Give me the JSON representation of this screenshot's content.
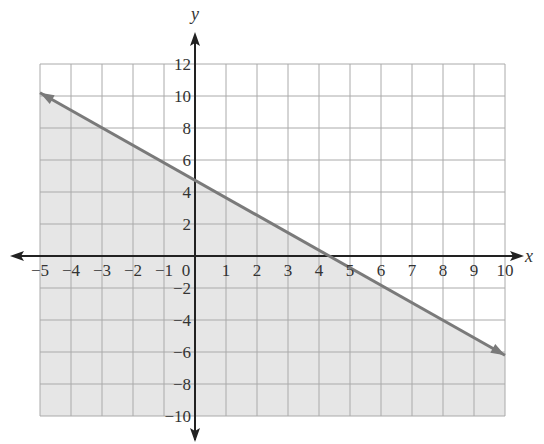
{
  "chart_data": {
    "type": "line",
    "title": "",
    "xlabel": "x",
    "ylabel": "y",
    "xlim": [
      -5,
      10
    ],
    "ylim": [
      -10,
      12
    ],
    "grid": true,
    "x_ticks": [
      -5,
      -4,
      -3,
      -2,
      -1,
      0,
      1,
      2,
      3,
      4,
      5,
      6,
      7,
      8,
      9,
      10
    ],
    "y_ticks": [
      -10,
      -8,
      -6,
      -4,
      -2,
      2,
      4,
      6,
      8,
      10,
      12
    ],
    "series": [
      {
        "name": "boundary line",
        "style": "solid",
        "x": [
          -5,
          0,
          4.35,
          10
        ],
        "y": [
          10.2,
          4.8,
          0,
          -6.2
        ]
      }
    ],
    "shaded_region": "below line",
    "colors": {
      "shade": "#e6e6e6",
      "line": "#7a7a7a",
      "grid": "#aaaaaa",
      "axis": "#222222"
    }
  }
}
